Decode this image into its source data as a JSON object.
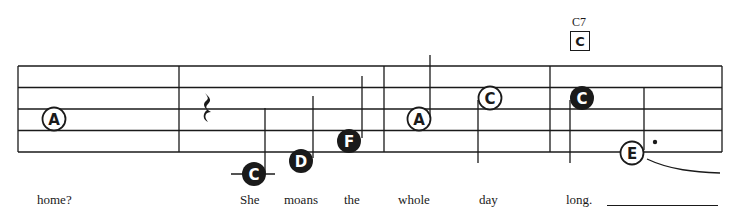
{
  "chord": {
    "name": "C7",
    "box_letter": "C"
  },
  "staff": {
    "line_count": 5,
    "line_color": "#1a1a1a",
    "measures": 4
  },
  "notes": [
    {
      "letter": "A",
      "style": "open",
      "measure": 1
    },
    {
      "type": "quarter-rest",
      "measure": 2
    },
    {
      "letter": "C",
      "style": "filled",
      "measure": 2,
      "ledger": true
    },
    {
      "letter": "D",
      "style": "filled",
      "measure": 2
    },
    {
      "letter": "F",
      "style": "filled",
      "measure": 2
    },
    {
      "letter": "A",
      "style": "open",
      "measure": 3
    },
    {
      "letter": "C",
      "style": "open",
      "measure": 3
    },
    {
      "letter": "C",
      "style": "filled",
      "measure": 4
    },
    {
      "letter": "E",
      "style": "open",
      "measure": 4,
      "dotted": true,
      "tied": true
    }
  ],
  "lyrics": [
    "home?",
    "She",
    "moans",
    "the",
    "whole",
    "day",
    "long."
  ]
}
